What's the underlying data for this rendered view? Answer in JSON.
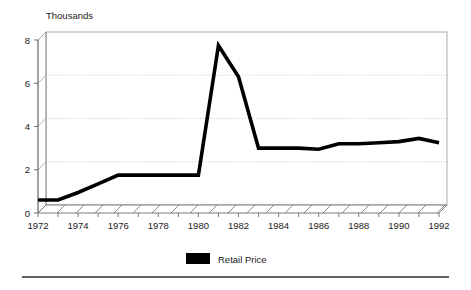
{
  "chart_data": {
    "type": "line",
    "title": "",
    "subtitle": "",
    "unit_label": "Thousands",
    "xlabel": "",
    "ylabel": "",
    "ylim": [
      0,
      8
    ],
    "xlim": [
      1972,
      1992
    ],
    "y_ticks": [
      "0",
      "2",
      "4",
      "6",
      "8"
    ],
    "y_tick_values": [
      0,
      2,
      4,
      6,
      8
    ],
    "x_ticks": [
      "1972",
      "1974",
      "1976",
      "1978",
      "1980",
      "1982",
      "1984",
      "1986",
      "1988",
      "1990",
      "1992"
    ],
    "x_tick_values": [
      1972,
      1974,
      1976,
      1978,
      1980,
      1982,
      1984,
      1986,
      1988,
      1990,
      1992
    ],
    "grid": "horizontal-dotted",
    "legend_position": "bottom-center",
    "style_3d": true,
    "series": [
      {
        "name": "Retail Price",
        "color": "#000000",
        "x": [
          1972,
          1973,
          1974,
          1975,
          1976,
          1977,
          1978,
          1979,
          1980,
          1981,
          1982,
          1983,
          1984,
          1985,
          1986,
          1987,
          1988,
          1989,
          1990,
          1991,
          1992
        ],
        "values": [
          0.6,
          0.6,
          0.95,
          1.35,
          1.75,
          1.75,
          1.75,
          1.75,
          1.75,
          7.75,
          6.3,
          3.0,
          3.0,
          3.0,
          2.95,
          3.2,
          3.2,
          3.25,
          3.3,
          3.45,
          3.25
        ]
      }
    ]
  },
  "legend": {
    "entries": [
      {
        "label": "Retail Price",
        "color": "#000000"
      }
    ]
  },
  "footer": {
    "rule": true
  }
}
